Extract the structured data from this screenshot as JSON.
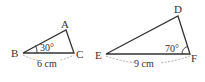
{
  "diagram": {
    "triangle_abc": {
      "vertices": {
        "A": "A",
        "B": "B",
        "C": "C"
      },
      "angle_B": "30°",
      "side_BC": "6 cm"
    },
    "triangle_def": {
      "vertices": {
        "D": "D",
        "E": "E",
        "F": "F"
      },
      "angle_F": "70°",
      "side_EF": "9 cm"
    },
    "colors": {
      "stroke": "#333333",
      "dashed": "#999999"
    }
  }
}
